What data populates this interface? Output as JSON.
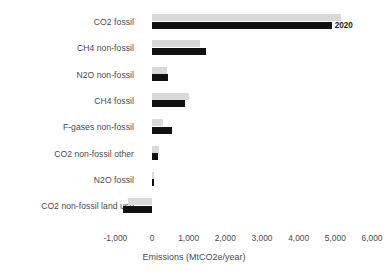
{
  "chart_data": {
    "type": "bar",
    "orientation": "horizontal",
    "title": "",
    "xlabel": "Emissions (MtCO2e/year)",
    "ylabel": "",
    "xlim": [
      -1000,
      6000
    ],
    "xticks": [
      "-1,000",
      "0",
      "1,000",
      "2,000",
      "3,000",
      "4,000",
      "5,000",
      "6,000"
    ],
    "xtick_values": [
      -1000,
      0,
      1000,
      2000,
      3000,
      4000,
      5000,
      6000
    ],
    "grid": false,
    "legend": "none",
    "categories": [
      "CO2 fossil",
      "CH4 non-fossil",
      "N2O non-fossil",
      "CH4 fossil",
      "F-gases non-fossil",
      "CO2 non-fossil other",
      "N2O fossil",
      "CO2 non-fossil land use"
    ],
    "series": [
      {
        "name": "earlier",
        "color": "#d9d9d9",
        "values": [
          5150,
          1320,
          420,
          1000,
          300,
          180,
          60,
          -650
        ]
      },
      {
        "name": "2020",
        "color": "#111111",
        "values": [
          4900,
          1480,
          440,
          900,
          550,
          170,
          50,
          -800
        ]
      }
    ],
    "annotations": [
      {
        "text": "2020",
        "category": "CO2 fossil",
        "series": "2020",
        "position": "end-of-bar"
      }
    ]
  }
}
